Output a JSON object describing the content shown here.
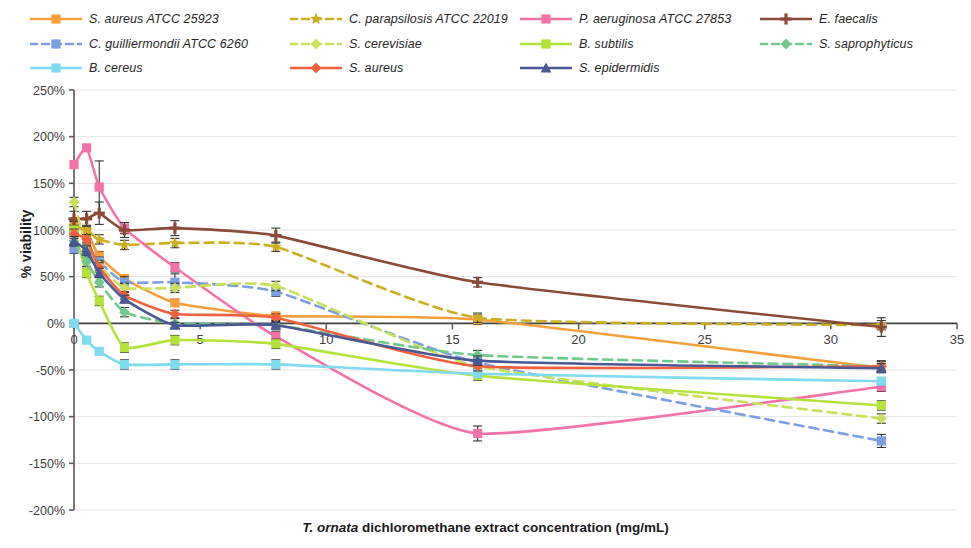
{
  "chart_data": {
    "type": "line",
    "title": "",
    "xlabel": "T. ornata dichloromethane extract concentration (mg/mL)",
    "xlabel_italic_prefix": "T. ornata",
    "xlabel_rest": " dichloromethane extract concentration (mg/mL)",
    "ylabel": "% viability",
    "xlim": [
      0,
      35
    ],
    "ylim": [
      -200,
      250
    ],
    "xticks": [
      0,
      5,
      10,
      15,
      20,
      25,
      30,
      35
    ],
    "xticklabels": [
      "0",
      "5",
      "10",
      "15",
      "20",
      "25",
      "30",
      "35"
    ],
    "yticks": [
      -200,
      -150,
      -100,
      -50,
      0,
      50,
      100,
      150,
      200,
      250
    ],
    "yticklabels": [
      "-200%",
      "-150%",
      "-100%",
      "-50%",
      "0%",
      "50%",
      "100%",
      "150%",
      "200%",
      "250%"
    ],
    "grid": true,
    "grid_axis": "y",
    "legend_position": "top",
    "x": [
      0,
      0.5,
      1,
      2,
      4,
      8,
      16,
      32
    ],
    "series": [
      {
        "name": "S. aureus ATCC 25923",
        "color": "#F5A03C",
        "dash": "solid",
        "marker": "square",
        "values": [
          104,
          98,
          72,
          48,
          22,
          8,
          4,
          -48
        ],
        "errors": [
          6,
          5,
          5,
          4,
          4,
          3,
          5,
          4
        ]
      },
      {
        "name": "C. parapsilosis ATCC 22019",
        "color": "#CDAE22",
        "dash": "dashed",
        "marker": "star",
        "values": [
          104,
          100,
          90,
          84,
          86,
          82,
          6,
          -2
        ],
        "errors": [
          5,
          5,
          5,
          5,
          5,
          5,
          5,
          5
        ]
      },
      {
        "name": "P. aeruginosa ATCC 27853",
        "color": "#F472A8",
        "dash": "solid",
        "marker": "square",
        "values": [
          170,
          188,
          146,
          102,
          60,
          -14,
          -118,
          -68
        ],
        "errors": [
          0,
          0,
          28,
          6,
          5,
          5,
          8,
          5
        ]
      },
      {
        "name": "E. faecalis",
        "color": "#8B4A36",
        "dash": "solid",
        "marker": "plus",
        "values": [
          112,
          112,
          118,
          100,
          102,
          94,
          44,
          -4
        ],
        "errors": [
          8,
          8,
          12,
          8,
          8,
          8,
          5,
          10
        ]
      },
      {
        "name": "C. guilliermondii ATCC 6260",
        "color": "#7B9FE0",
        "dash": "dashed",
        "marker": "square",
        "values": [
          80,
          74,
          66,
          44,
          44,
          34,
          -42,
          -126
        ],
        "errors": [
          5,
          5,
          5,
          6,
          9,
          5,
          6,
          7
        ]
      },
      {
        "name": "S. cerevisiae",
        "color": "#C8E05A",
        "dash": "dashed",
        "marker": "diamond",
        "values": [
          130,
          82,
          62,
          38,
          38,
          40,
          -46,
          -102
        ],
        "errors": [
          5,
          5,
          5,
          5,
          5,
          5,
          5,
          5
        ]
      },
      {
        "name": "B. subtilis",
        "color": "#B5E23A",
        "dash": "solid",
        "marker": "square",
        "values": [
          100,
          54,
          24,
          -26,
          -18,
          -22,
          -56,
          -88
        ],
        "errors": [
          5,
          5,
          5,
          5,
          5,
          5,
          5,
          5
        ]
      },
      {
        "name": "S. saprophyticus",
        "color": "#70C88A",
        "dash": "dashed",
        "marker": "diamond",
        "values": [
          88,
          66,
          44,
          12,
          0,
          -2,
          -34,
          -46
        ],
        "errors": [
          5,
          5,
          5,
          5,
          5,
          5,
          5,
          5
        ]
      },
      {
        "name": "B. cereus",
        "color": "#7FDCF0",
        "dash": "solid",
        "marker": "square",
        "values": [
          0,
          -18,
          -30,
          -44,
          -44,
          -44,
          -54,
          -62
        ],
        "errors": [
          3,
          3,
          3,
          5,
          5,
          5,
          4,
          4
        ]
      },
      {
        "name": "S. aureus",
        "color": "#F2613F",
        "dash": "solid",
        "marker": "diamond",
        "values": [
          96,
          90,
          60,
          30,
          10,
          6,
          -46,
          -46
        ],
        "errors": [
          5,
          5,
          5,
          4,
          4,
          4,
          5,
          6
        ]
      },
      {
        "name": "S. epidermidis",
        "color": "#4A5896",
        "dash": "solid",
        "marker": "triangle",
        "values": [
          88,
          78,
          54,
          26,
          -2,
          -2,
          -40,
          -48
        ],
        "errors": [
          5,
          5,
          5,
          4,
          3,
          3,
          5,
          5
        ]
      }
    ]
  },
  "legend": {
    "rows": [
      [
        {
          "label": "S. aureus ATCC 25923",
          "series": 0
        },
        {
          "label": "C. parapsilosis ATCC 22019",
          "series": 1
        },
        {
          "label": "P. aeruginosa ATCC 27853",
          "series": 2
        },
        {
          "label": "E. faecalis",
          "series": 3
        }
      ],
      [
        {
          "label": "C. guilliermondii ATCC 6260",
          "series": 4
        },
        {
          "label": "S. cerevisiae",
          "series": 5
        },
        {
          "label": "B. subtilis",
          "series": 6
        },
        {
          "label": "S. saprophyticus",
          "series": 7
        }
      ],
      [
        {
          "label": "B. cereus",
          "series": 8
        },
        {
          "label": "S. aureus",
          "series": 9
        },
        {
          "label": "S. epidermidis",
          "series": 10
        }
      ]
    ],
    "column_x": [
      30,
      290,
      520,
      760
    ],
    "row_y": [
      8,
      33,
      57
    ]
  },
  "axes": {
    "y_title": "% viability",
    "x_title_italic": "T. ornata",
    "x_title_rest": " dichloromethane extract concentration (mg/mL)"
  }
}
